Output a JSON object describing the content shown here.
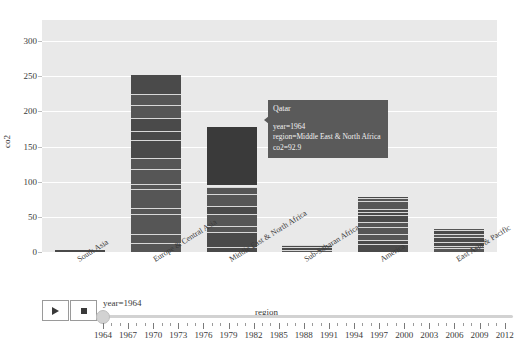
{
  "chart_data": {
    "type": "bar",
    "title": "",
    "xlabel": "region",
    "ylabel": "co2",
    "ylim": [
      0,
      330
    ],
    "yticks": [
      0,
      50,
      100,
      150,
      200,
      250,
      300
    ],
    "grid": true,
    "stacked": true,
    "categories": [
      "South Asia",
      "Europe & Central Asia",
      "Middle East & North Africa",
      "Sub-Saharan Africa",
      "America",
      "East Asia & Pacific"
    ],
    "values": [
      3,
      252,
      178,
      10,
      78,
      33
    ],
    "legend_position": "none",
    "annotations": [
      "Qatar segment highlighted in Middle East & North Africa bar at co2=92.9"
    ],
    "bar_color": "#4a4a4a",
    "plot_background": "#e9e9e9",
    "gridline_color": "#ffffff"
  },
  "tooltip": {
    "title": "Qatar",
    "rows": [
      "year=1964",
      "region=Middle East & North Africa",
      "co2=92.9"
    ],
    "background": "#5a5a5a"
  },
  "controls": {
    "play_label": "play-icon",
    "pause_label": "stop-icon"
  },
  "slider": {
    "label": "year=1964",
    "value": 1964,
    "min": 1964,
    "max": 2013,
    "ticks": [
      1964,
      1967,
      1970,
      1973,
      1976,
      1979,
      1982,
      1985,
      1988,
      1991,
      1994,
      1997,
      2000,
      2003,
      2006,
      2009,
      2012
    ]
  }
}
